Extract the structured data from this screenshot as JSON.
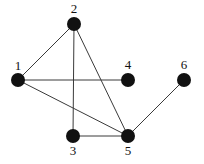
{
  "diagram": {
    "type": "undirected-graph",
    "nodes": [
      {
        "id": "1",
        "label": "1",
        "x": 18,
        "y": 80,
        "label_x": 18,
        "label_y": 67
      },
      {
        "id": "2",
        "label": "2",
        "x": 74,
        "y": 24,
        "label_x": 74,
        "label_y": 10
      },
      {
        "id": "3",
        "label": "3",
        "x": 73,
        "y": 136,
        "label_x": 73,
        "label_y": 152
      },
      {
        "id": "4",
        "label": "4",
        "x": 128,
        "y": 80,
        "label_x": 128,
        "label_y": 66
      },
      {
        "id": "5",
        "label": "5",
        "x": 128,
        "y": 136,
        "label_x": 128,
        "label_y": 152
      },
      {
        "id": "6",
        "label": "6",
        "x": 184,
        "y": 80,
        "label_x": 184,
        "label_y": 66
      }
    ],
    "edges": [
      {
        "from": "1",
        "to": "2"
      },
      {
        "from": "1",
        "to": "4"
      },
      {
        "from": "1",
        "to": "5"
      },
      {
        "from": "2",
        "to": "3"
      },
      {
        "from": "2",
        "to": "5"
      },
      {
        "from": "3",
        "to": "5"
      },
      {
        "from": "5",
        "to": "6"
      }
    ],
    "node_radius": 7,
    "colors": {
      "node": "#111111",
      "edge": "#3a3a3a",
      "background": "#ffffff"
    }
  }
}
